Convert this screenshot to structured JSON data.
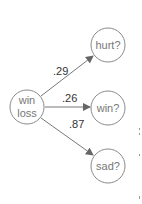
{
  "diagram": {
    "source_node": {
      "line1": "win",
      "line2": "loss"
    },
    "target_nodes": [
      {
        "label": "hurt?"
      },
      {
        "label": "win?"
      },
      {
        "label": "sad?"
      }
    ],
    "edges": [
      {
        "from": "win loss",
        "to": "hurt?",
        "weight": ".29"
      },
      {
        "from": "win loss",
        "to": "win?",
        "weight": ".26"
      },
      {
        "from": "win loss",
        "to": "sad?",
        "weight": ".87"
      }
    ],
    "colors": {
      "stroke": "#8a8a8a",
      "text": "#777777",
      "edge_label": "#333333"
    }
  }
}
